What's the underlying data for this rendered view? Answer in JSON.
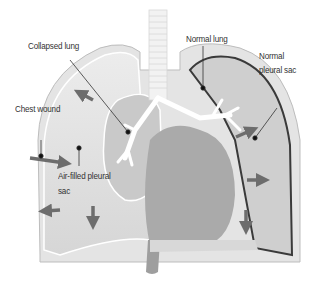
{
  "diagram": {
    "labels": {
      "collapsed_lung": "Collapsed lung",
      "normal_lung": "Normal lung",
      "normal_pleural_sac_line1": "Normal",
      "normal_pleural_sac_line2": "pleural sac",
      "chest_wound": "Chest wound",
      "air_filled_pleural_sac_line1": "Air-filled pleural",
      "air_filled_pleural_sac_line2": "sac"
    },
    "colors": {
      "background": "#ffffff",
      "chest_wall": "#e4e4e4",
      "chest_wall_stroke": "#bdbdbd",
      "air_space": "#e9e9e9",
      "lung_tissue": "#c9c9c9",
      "heart": "#a9a9a9",
      "pleural_line": "#3a3a3a",
      "trachea": "#f2f2f2",
      "bronchi": "#ffffff",
      "arrow": "#6d6d6d",
      "leader_line": "#333333",
      "label_text": "#333333"
    }
  }
}
